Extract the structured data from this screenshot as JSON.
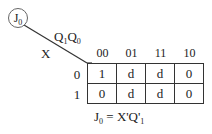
{
  "diagram": {
    "title_circle": {
      "main": "J",
      "sub": "0"
    },
    "corner": {
      "col_var": {
        "q1": "Q",
        "q1_sub": "1",
        "q0": "Q",
        "q0_sub": "0"
      },
      "row_var": "X"
    },
    "columns": [
      "00",
      "01",
      "11",
      "10"
    ],
    "rows": [
      {
        "label": "0",
        "cells": [
          "1",
          "d",
          "d",
          "0"
        ]
      },
      {
        "label": "1",
        "cells": [
          "0",
          "d",
          "d",
          "0"
        ]
      }
    ],
    "equation": {
      "lhs": "J",
      "lhs_sub": "0",
      "rhs": " = X'Q'",
      "rhs_sub": "1"
    }
  }
}
